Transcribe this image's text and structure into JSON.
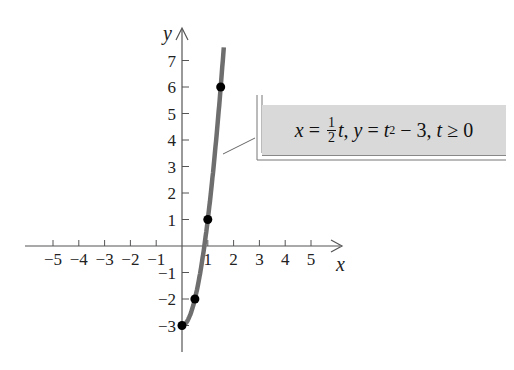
{
  "chart_data": {
    "type": "line",
    "title": "",
    "xlabel": "x",
    "ylabel": "y",
    "xlim": [
      -6,
      6.5
    ],
    "ylim": [
      -4,
      8.5
    ],
    "x_ticks": [
      -5,
      -4,
      -3,
      -2,
      -1,
      1,
      2,
      3,
      4,
      5
    ],
    "x_tick_labels": [
      "−5",
      "−4",
      "−3",
      "−2",
      "−1",
      "1",
      "2",
      "3",
      "4",
      "5"
    ],
    "y_ticks": [
      -3,
      -2,
      -1,
      1,
      2,
      3,
      4,
      5,
      6,
      7
    ],
    "y_tick_labels": [
      "−3",
      "−2",
      "−1",
      "1",
      "2",
      "3",
      "4",
      "5",
      "6",
      "7"
    ],
    "grid": false,
    "series": [
      {
        "name": "x = (1/2)t, y = t^2 − 3, t ≥ 0",
        "equation": "y = 4x^2 − 3, x ≥ 0",
        "color": "#6e6e6e",
        "x": [
          0,
          0.25,
          0.5,
          0.75,
          1,
          1.25,
          1.5,
          1.625
        ],
        "y": [
          -3,
          -2.75,
          -2,
          -0.75,
          1,
          3.25,
          6,
          7.5625
        ]
      }
    ],
    "points": [
      {
        "t": 0,
        "x": 0,
        "y": -3
      },
      {
        "t": 1,
        "x": 0.5,
        "y": -2
      },
      {
        "t": 2,
        "x": 1,
        "y": 1
      },
      {
        "t": 3,
        "x": 1.5,
        "y": 6
      }
    ],
    "annotations": [
      {
        "text": "x = ½t, y = t² − 3, t ≥ 0",
        "points_to": [
          1.3,
          3.5
        ]
      }
    ]
  },
  "labels": {
    "x_axis": "x",
    "y_axis": "y",
    "callout": {
      "x_var": "x",
      "eq": " = ",
      "frac_num": "1",
      "frac_den": "2",
      "t1": "t",
      "sep1": ", ",
      "y_var": "y",
      "eq2": " = ",
      "t2": "t",
      "exp": "2",
      "rest": " − 3, ",
      "t3": "t",
      "cond": " ≥ 0"
    }
  }
}
